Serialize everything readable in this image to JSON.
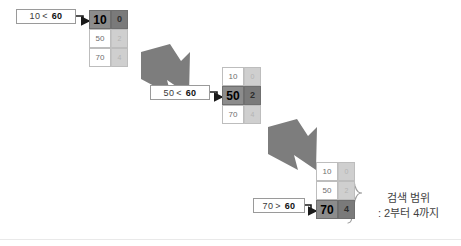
{
  "diagram": {
    "background": "#ffffff",
    "accent_highlight": "#8c8c8c",
    "accent_value": "#7a7a7a",
    "accent_idle": "#cfcfcf",
    "arrow_color": "#7d7d7d"
  },
  "steps": [
    {
      "id": "step-1",
      "condition": {
        "left": "10",
        "op": "<",
        "right": "60"
      },
      "rows": [
        {
          "key": "10",
          "value": "0",
          "active": true
        },
        {
          "key": "50",
          "value": "2",
          "active": false
        },
        {
          "key": "70",
          "value": "4",
          "active": false
        }
      ]
    },
    {
      "id": "step-2",
      "condition": {
        "left": "50",
        "op": "<",
        "right": "60"
      },
      "rows": [
        {
          "key": "10",
          "value": "0",
          "active": false
        },
        {
          "key": "50",
          "value": "2",
          "active": true
        },
        {
          "key": "70",
          "value": "4",
          "active": false
        }
      ]
    },
    {
      "id": "step-3",
      "condition": {
        "left": "70",
        "op": ">",
        "right": "60"
      },
      "rows": [
        {
          "key": "10",
          "value": "0",
          "active": false
        },
        {
          "key": "50",
          "value": "2",
          "active": false
        },
        {
          "key": "70",
          "value": "4",
          "active": true
        }
      ]
    }
  ],
  "caption": {
    "line1": "검색 범위",
    "line2": ": 2부터 4까지"
  }
}
